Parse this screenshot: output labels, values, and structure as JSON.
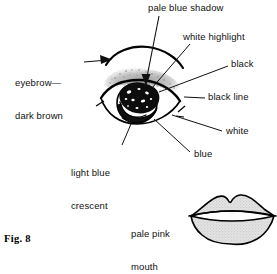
{
  "figure": {
    "caption": "Fig. 8"
  },
  "labels": {
    "pale_blue_shadow": "pale blue shadow",
    "white_highlight": "white highlight",
    "black": "black",
    "black_line": "black line",
    "white": "white",
    "blue": "blue",
    "light_blue_crescent_line1": "light blue",
    "light_blue_crescent_line2": "crescent",
    "eyebrow_line1": "eyebrow—",
    "eyebrow_line2": "dark brown",
    "pale_pink_mouth_line1": "pale pink",
    "pale_pink_mouth_line2": "mouth"
  },
  "colors": {
    "ink": "#111111",
    "line": "#000000",
    "stipple_gray": "#8c8c8c",
    "shadow_gray": "#9a9a9a",
    "lip_fill": "#d9d9d9",
    "pupil_black": "#0d0d0d",
    "background": "#ffffff"
  },
  "diagram_parts": {
    "eyebrow": "arched-brow-stroke",
    "eyeshadow": "stippled-lid-shadow",
    "eye_outline": "almond-eye-outline",
    "iris": "iris-circle",
    "pupil": "dark-pupil-blob",
    "highlights": "white-speckle-highlights",
    "crescent": "light-blue-crescent",
    "lower_lid": "lower-lid-line",
    "mouth": "lips-outline"
  }
}
